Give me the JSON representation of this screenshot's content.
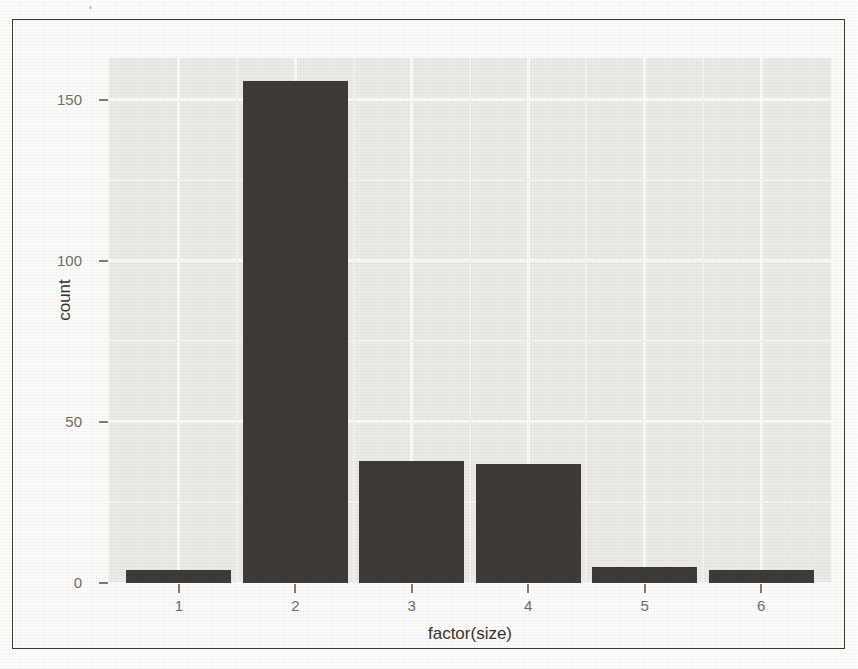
{
  "chart_data": {
    "type": "bar",
    "title": "",
    "subtitle": "",
    "xlabel": "factor(size)",
    "ylabel": "count",
    "categories": [
      "1",
      "2",
      "3",
      "4",
      "5",
      "6"
    ],
    "values": [
      4,
      156,
      38,
      37,
      5,
      4
    ],
    "series": [
      {
        "name": "count",
        "values": [
          4,
          156,
          38,
          37,
          5,
          4
        ]
      }
    ],
    "ylim": [
      0,
      163
    ],
    "xlim": [
      0.4,
      6.6
    ],
    "y_ticks": [
      0,
      50,
      100,
      150
    ],
    "y_tick_labels": [
      "0",
      "50",
      "100",
      "150"
    ],
    "x_ticks": [
      1,
      2,
      3,
      4,
      5,
      6
    ],
    "x_tick_labels": [
      "1",
      "2",
      "3",
      "4",
      "5",
      "6"
    ],
    "grid": true,
    "grid_minor": true,
    "legend": false,
    "legend_position": "none",
    "annotations": [],
    "colors": {
      "bar_fill": "#3c3833",
      "panel_background": "#ecebe7",
      "grid_major": "#fbfbfa",
      "grid_minor": "#f5f4f1",
      "axis_text": "#6f6c67",
      "axis_title": "#34312d",
      "frame_border": "#3a3732",
      "figure_background": "#fdfcfb"
    }
  }
}
